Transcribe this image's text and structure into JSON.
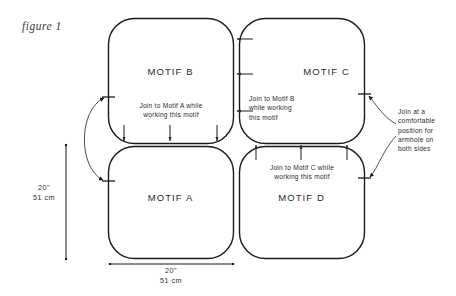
{
  "figure": {
    "caption": "figure 1",
    "background_color": "#ffffff",
    "line_color": "#1a1a1a",
    "text_color": "#2b2b2b"
  },
  "motifs": [
    {
      "id": "motif-b",
      "label": "MOTIF B",
      "position": "top-left"
    },
    {
      "id": "motif-c",
      "label": "MOTIF C",
      "position": "top-right"
    },
    {
      "id": "motif-a",
      "label": "MOTIF A",
      "position": "bottom-left"
    },
    {
      "id": "motif-d",
      "label": "MOTIF D",
      "position": "bottom-right"
    }
  ],
  "notes": {
    "motif_b_note_line1": "Join to Motif A while",
    "motif_b_note_line2": "working this motif",
    "motif_c_note_line1": "Join to Motif B",
    "motif_c_note_line2": "while working",
    "motif_c_note_line3": "this motif",
    "motif_d_note_line1": "Join to Motif C while",
    "motif_d_note_line2": "working this motif",
    "armhole_note_line1": "Join at a",
    "armhole_note_line2": "comfortable",
    "armhole_note_line3": "position for",
    "armhole_note_line4": "armhole on",
    "armhole_note_line5": "both sides"
  },
  "dimensions": {
    "vertical": {
      "imperial": "20\"",
      "metric": "51 cm"
    },
    "horizontal": {
      "imperial": "20\"",
      "metric": "51 cm"
    }
  },
  "arrows": {
    "b_to_a_count": 3,
    "c_to_b_count": 3,
    "d_to_c_count": 3,
    "left_seam_double_arrow": true,
    "right_armhole_arrows": 2
  }
}
